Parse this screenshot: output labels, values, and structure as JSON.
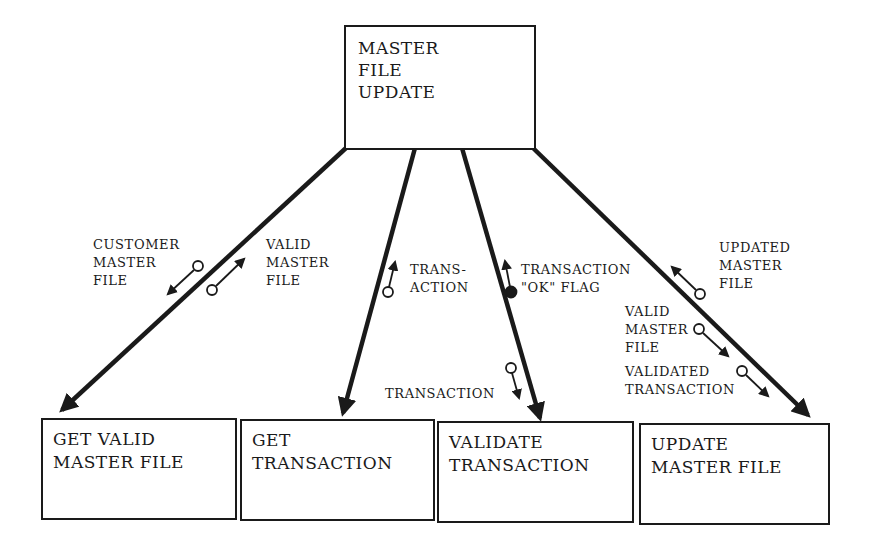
{
  "diagram": {
    "type": "structure-chart",
    "root": {
      "label": "MASTER\nFILE\nUPDATE"
    },
    "modules": [
      {
        "id": "get-valid-master-file",
        "label": "GET VALID\nMASTER FILE"
      },
      {
        "id": "get-transaction",
        "label": "GET\nTRANSACTION"
      },
      {
        "id": "validate-transaction",
        "label": "VALIDATE\nTRANSACTION"
      },
      {
        "id": "update-master-file",
        "label": "UPDATE\nMASTER FILE"
      }
    ],
    "couples": [
      {
        "label": "CUSTOMER\nMASTER\nFILE",
        "kind": "data",
        "direction": "down",
        "module": "get-valid-master-file"
      },
      {
        "label": "VALID\nMASTER\nFILE",
        "kind": "data",
        "direction": "up",
        "module": "get-valid-master-file"
      },
      {
        "label": "TRANS-\nACTION",
        "kind": "data",
        "direction": "up",
        "module": "get-transaction"
      },
      {
        "label": "TRANSACTION\n\"OK\" FLAG",
        "kind": "control",
        "direction": "up",
        "module": "validate-transaction"
      },
      {
        "label": "TRANSACTION",
        "kind": "data",
        "direction": "down",
        "module": "validate-transaction"
      },
      {
        "label": "UPDATED\nMASTER\nFILE",
        "kind": "data",
        "direction": "up",
        "module": "update-master-file"
      },
      {
        "label": "VALID\nMASTER\nFILE",
        "kind": "data",
        "direction": "down",
        "module": "update-master-file"
      },
      {
        "label": "VALIDATED\nTRANSACTION",
        "kind": "data",
        "direction": "down",
        "module": "update-master-file"
      }
    ]
  },
  "colors": {
    "ink": "#1a1a1a",
    "background": "#ffffff"
  }
}
